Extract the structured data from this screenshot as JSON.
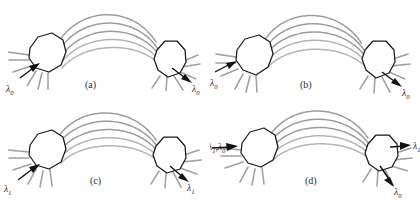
{
  "figure": {
    "background_color": "#ffffff",
    "node_outline_color": "#1a1a1a",
    "fiber_color": "#9b9b9b",
    "arrow_color": "#111111",
    "fiber_count": 5,
    "panel_count": 4
  },
  "panels": [
    {
      "id": "a",
      "caption": "(a)",
      "input_label": "λ",
      "input_sub": "0",
      "output_label": "λ",
      "output_sub": "0",
      "inputs": [
        {
          "label": "λ",
          "sub": "0",
          "direction": "in"
        }
      ],
      "outputs": [
        {
          "label": "λ",
          "sub": "0",
          "direction": "out"
        }
      ]
    },
    {
      "id": "b",
      "caption": "(b)",
      "input_label": "λ",
      "input_sub": "0",
      "output_label": "λ",
      "output_sub": "0",
      "inputs": [
        {
          "label": "λ",
          "sub": "0",
          "direction": "in"
        }
      ],
      "outputs": [
        {
          "label": "λ",
          "sub": "0",
          "direction": "out"
        }
      ]
    },
    {
      "id": "c",
      "caption": "(c)",
      "input_label": "λ",
      "input_sub": "1",
      "output_label": "λ",
      "output_sub": "1",
      "inputs": [
        {
          "label": "λ",
          "sub": "1",
          "direction": "in"
        }
      ],
      "outputs": [
        {
          "label": "λ",
          "sub": "1",
          "direction": "out"
        }
      ]
    },
    {
      "id": "d",
      "caption": "(d)",
      "input_label_full": "λ₁,λ₀",
      "input_label_a": "λ",
      "input_sub_a": "1",
      "input_sep": ",",
      "input_label_b": "λ",
      "input_sub_b": "0",
      "output_label_top": "λ",
      "output_sub_top": "1",
      "output_label_bottom": "λ",
      "output_sub_bottom": "0",
      "inputs": [
        {
          "label": "λ",
          "sub": "1",
          "direction": "in"
        },
        {
          "label": "λ",
          "sub": "0",
          "direction": "in"
        }
      ],
      "outputs": [
        {
          "label": "λ",
          "sub": "1",
          "direction": "out"
        },
        {
          "label": "λ",
          "sub": "0",
          "direction": "out"
        }
      ]
    }
  ]
}
